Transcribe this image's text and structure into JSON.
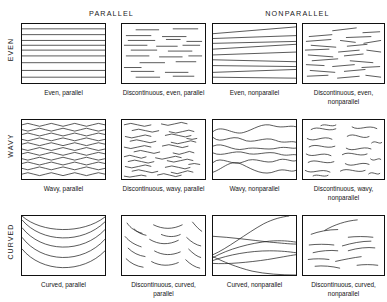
{
  "figure": {
    "column_headers": [
      {
        "id": "parallel",
        "label": "PARALLEL"
      },
      {
        "id": "nonparallel",
        "label": "NONPARALLEL"
      }
    ],
    "row_labels": [
      {
        "id": "even",
        "label": "EVEN"
      },
      {
        "id": "wavy",
        "label": "WAVY"
      },
      {
        "id": "curved",
        "label": "CURVED"
      }
    ],
    "line_color": "#1d1d1d",
    "border_color": "#111111",
    "background_color": "#ffffff",
    "panels": [
      {
        "id": "even-parallel",
        "row": "EVEN",
        "column": "PARALLEL",
        "caption": "Even, parallel",
        "continuity": "continuous",
        "geometry": "even",
        "parallelism": "parallel",
        "line_count": 9
      },
      {
        "id": "discontinuous-even-parallel",
        "row": "EVEN",
        "column": "PARALLEL",
        "caption": "Discontinuous, even, parallel",
        "continuity": "discontinuous",
        "geometry": "even",
        "parallelism": "parallel",
        "line_count": 22
      },
      {
        "id": "even-nonparallel",
        "row": "EVEN",
        "column": "NONPARALLEL",
        "caption": "Even, nonparallel",
        "continuity": "continuous",
        "geometry": "even",
        "parallelism": "nonparallel",
        "line_count": 9
      },
      {
        "id": "discontinuous-even-nonparallel",
        "row": "EVEN",
        "column": "NONPARALLEL",
        "caption": "Discontinuous, even, nonparallel",
        "continuity": "discontinuous",
        "geometry": "even",
        "parallelism": "nonparallel",
        "line_count": 24
      },
      {
        "id": "wavy-parallel",
        "row": "WAVY",
        "column": "PARALLEL",
        "caption": "Wavy, parallel",
        "continuity": "continuous",
        "geometry": "wavy",
        "parallelism": "parallel",
        "line_count": 11
      },
      {
        "id": "discontinuous-wavy-parallel",
        "row": "WAVY",
        "column": "PARALLEL",
        "caption": "Discontinuous, wavy, parallel",
        "continuity": "discontinuous",
        "geometry": "wavy",
        "parallelism": "parallel",
        "line_count": 24
      },
      {
        "id": "wavy-nonparallel",
        "row": "WAVY",
        "column": "NONPARALLEL",
        "caption": "Wavy, nonparallel",
        "continuity": "continuous",
        "geometry": "wavy",
        "parallelism": "nonparallel",
        "line_count": 6
      },
      {
        "id": "discontinuous-wavy-nonparallel",
        "row": "WAVY",
        "column": "NONPARALLEL",
        "caption": "Discontinuous, wavy, nonparallel",
        "continuity": "discontinuous",
        "geometry": "wavy",
        "parallelism": "nonparallel",
        "line_count": 17
      },
      {
        "id": "curved-parallel",
        "row": "CURVED",
        "column": "PARALLEL",
        "caption": "Curved, parallel",
        "continuity": "continuous",
        "geometry": "curved",
        "parallelism": "parallel",
        "line_count": 5
      },
      {
        "id": "discontinuous-curved-parallel",
        "row": "CURVED",
        "column": "PARALLEL",
        "caption": "Discontinuous, curved, parallel",
        "continuity": "discontinuous",
        "geometry": "curved",
        "parallelism": "parallel",
        "line_count": 14
      },
      {
        "id": "curved-nonparallel",
        "row": "CURVED",
        "column": "NONPARALLEL",
        "caption": "Curved, nonparallel",
        "continuity": "continuous",
        "geometry": "curved",
        "parallelism": "nonparallel",
        "line_count": 6
      },
      {
        "id": "discontinuous-curved-nonparallel",
        "row": "CURVED",
        "column": "NONPARALLEL",
        "caption": "Discontinuous, curved, nonparallel",
        "continuity": "discontinuous",
        "geometry": "curved",
        "parallelism": "nonparallel",
        "line_count": 11
      }
    ]
  }
}
